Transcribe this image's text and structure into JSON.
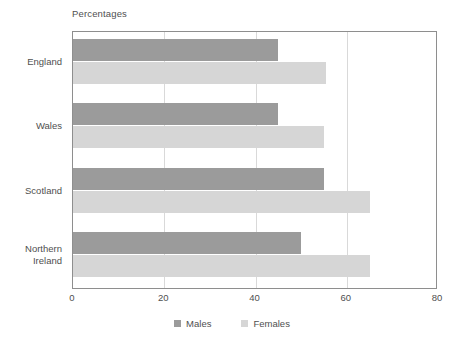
{
  "chart_data": {
    "type": "bar",
    "orientation": "horizontal",
    "title": "Percentages",
    "xlabel": "",
    "ylabel": "",
    "xlim": [
      0,
      80
    ],
    "xticks": [
      0,
      20,
      40,
      60,
      80
    ],
    "xtick_labels": [
      "0",
      "20",
      "40",
      "60",
      "80"
    ],
    "grid": "vertical",
    "legend_position": "bottom-center",
    "categories": [
      "England",
      "Wales",
      "Scotland",
      "Northern\nIreland"
    ],
    "series": [
      {
        "name": "Males",
        "color": "#9b9b9b",
        "values": [
          45,
          45,
          55,
          50
        ]
      },
      {
        "name": "Females",
        "color": "#d6d6d6",
        "values": [
          55.5,
          55,
          65,
          65
        ]
      }
    ]
  },
  "legend": {
    "items": [
      {
        "label": "Males",
        "swatch": "males-swatch"
      },
      {
        "label": "Females",
        "swatch": "females-swatch"
      }
    ]
  },
  "colors": {
    "males": "#9b9b9b",
    "females": "#d6d6d6",
    "frame": "#8e8e8e",
    "gridline": "#d9d9d9",
    "text": "#4f4f4f",
    "background": "#ffffff"
  }
}
